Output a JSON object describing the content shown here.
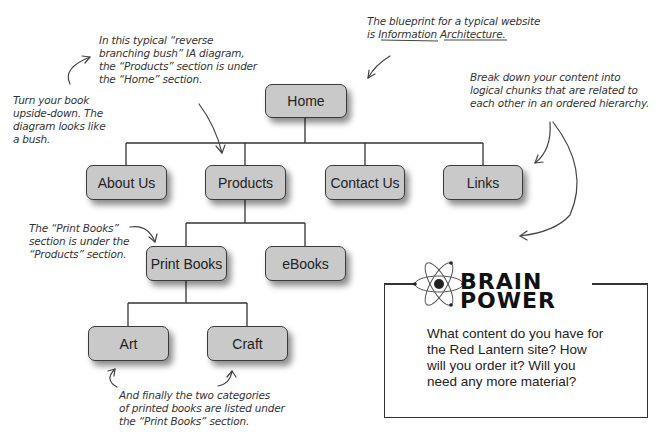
{
  "diagram": {
    "type": "information-architecture-tree",
    "nodes": {
      "home": "Home",
      "about": "About Us",
      "products": "Products",
      "contact": "Contact Us",
      "links": "Links",
      "print_books": "Print Books",
      "ebooks": "eBooks",
      "art": "Art",
      "craft": "Craft"
    },
    "edges": [
      [
        "Home",
        "About Us"
      ],
      [
        "Home",
        "Products"
      ],
      [
        "Home",
        "Contact Us"
      ],
      [
        "Home",
        "Links"
      ],
      [
        "Products",
        "Print Books"
      ],
      [
        "Products",
        "eBooks"
      ],
      [
        "Print Books",
        "Art"
      ],
      [
        "Print Books",
        "Craft"
      ]
    ]
  },
  "annotations": {
    "blueprint": {
      "line1": "The blueprint for a typical website",
      "line2_prefix": "is ",
      "line2_u1": "Information",
      "line2_u2": "Architecture",
      "line2_suffix": "."
    },
    "reverse_bush": [
      "In this typical “reverse",
      "branching bush” IA diagram,",
      "the “Products” section is under",
      "the “Home” section."
    ],
    "upside_down": [
      "Turn your book",
      "upside-down. The",
      "diagram looks like",
      "a bush."
    ],
    "break_down": [
      "Break down your content into",
      "logical chunks that are related to",
      "each other in an ordered hierarchy."
    ],
    "print_books_note": [
      "The “Print Books”",
      "section is under the",
      "“Products” section."
    ],
    "final_note": [
      "And finally the two categories",
      "of printed books are listed under",
      "the “Print Books” section."
    ]
  },
  "brain_power": {
    "title_line1": "BRAIN",
    "title_line2": "POWER",
    "text": [
      "What content do you have for",
      "the Red Lantern site? How",
      "will you order it? Will you",
      "need any more material?"
    ]
  }
}
